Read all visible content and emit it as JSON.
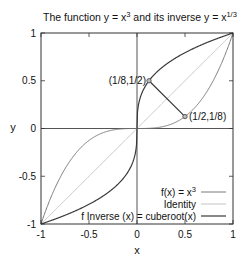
{
  "chart_data": {
    "type": "line",
    "title_parts": {
      "prefix": "The function y = x",
      "sup1": "3",
      "middle": " and its inverse y = x",
      "sup2": "1/3"
    },
    "xlabel": "x",
    "ylabel": "y",
    "xlim": [
      -1,
      1
    ],
    "ylim": [
      -1,
      1
    ],
    "xticks": [
      -1,
      -0.5,
      0,
      0.5,
      1
    ],
    "xtick_labels": [
      "-1",
      "-0.5",
      "0",
      "0.5",
      "1"
    ],
    "yticks": [
      -1,
      -0.5,
      0,
      0.5,
      1
    ],
    "ytick_labels": [
      "-1",
      "-0.5",
      "0",
      "0.5",
      "1"
    ],
    "grid": false,
    "zero_axes": true,
    "legend_position": "lower right",
    "series": [
      {
        "name": "f(x) = x^3",
        "label_prefix": "f(x) = x",
        "label_sup": "3",
        "function": "cube",
        "color": "#7a7a7a",
        "width": 1.0
      },
      {
        "name": "Identity",
        "label_prefix": "Identity",
        "label_sup": "",
        "function": "identity",
        "color": "#c4c4c4",
        "width": 1.0
      },
      {
        "name": "f Inverse (x) = cuberoot(x)",
        "label_prefix": "f Inverse (x) = cuberoot(x)",
        "label_sup": "",
        "function": "cbrt",
        "color": "#3a3a3a",
        "width": 1.2
      }
    ],
    "points": [
      {
        "x": 0.125,
        "y": 0.5,
        "label": "(1/8,1/2)",
        "label_side": "left"
      },
      {
        "x": 0.5,
        "y": 0.125,
        "label": "(1/2,1/8)",
        "label_side": "right"
      }
    ],
    "connector": {
      "from": [
        0.125,
        0.5
      ],
      "to": [
        0.5,
        0.125
      ],
      "color": "#3a3a3a"
    }
  }
}
